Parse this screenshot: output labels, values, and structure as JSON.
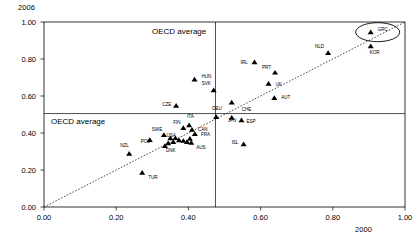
{
  "chart_data": {
    "type": "scatter",
    "title": "",
    "xlabel": "2000",
    "ylabel": "2006",
    "xlim": [
      0.0,
      1.0
    ],
    "ylim": [
      0.0,
      1.0
    ],
    "xticks": [
      "0.00",
      "0.20",
      "0.40",
      "0.60",
      "0.80",
      "1.00"
    ],
    "yticks": [
      "0.00",
      "0.20",
      "0.40",
      "0.60",
      "0.80",
      "1.00"
    ],
    "xtick_values": [
      0.0,
      0.2,
      0.4,
      0.6,
      0.8,
      1.0
    ],
    "ytick_values": [
      0.0,
      0.2,
      0.4,
      0.6,
      0.8,
      1.0
    ],
    "grid": false,
    "legend": "none",
    "annotations": [
      {
        "name": "oecd-average-vertical",
        "text": "OECD average",
        "value": 0.475,
        "orientation": "vertical"
      },
      {
        "name": "oecd-average-horizontal",
        "text": "OECD average",
        "value": 0.505,
        "orientation": "horizontal"
      }
    ],
    "reference_line": {
      "name": "45-degree-line",
      "style": "dotted",
      "from": [
        0.0,
        0.0
      ],
      "to": [
        1.0,
        1.0
      ]
    },
    "highlight": {
      "label": "GRC",
      "shape": "ellipse"
    },
    "points": [
      {
        "label": "GRC",
        "x": 0.905,
        "y": 0.945,
        "lx": 7,
        "ly": -1
      },
      {
        "label": "KOR",
        "x": 0.905,
        "y": 0.87,
        "lx": -1,
        "ly": 8
      },
      {
        "label": "NLD",
        "x": 0.787,
        "y": 0.833,
        "lx": -13,
        "ly": -5
      },
      {
        "label": "IRL",
        "x": 0.583,
        "y": 0.783,
        "lx": -14,
        "ly": 2
      },
      {
        "label": "PRT",
        "x": 0.64,
        "y": 0.727,
        "lx": -13,
        "ly": -4
      },
      {
        "label": "HUN",
        "x": 0.417,
        "y": 0.69,
        "lx": 7,
        "ly": -1
      },
      {
        "label": "UK",
        "x": 0.622,
        "y": 0.667,
        "lx": 7,
        "ly": 2
      },
      {
        "label": "SVK",
        "x": 0.47,
        "y": 0.632,
        "lx": -12,
        "ly": -5
      },
      {
        "label": "AUT",
        "x": 0.638,
        "y": 0.59,
        "lx": 7,
        "ly": 1
      },
      {
        "label": "CZE",
        "x": 0.366,
        "y": 0.548,
        "lx": -14,
        "ly": 0
      },
      {
        "label": "CHE",
        "x": 0.52,
        "y": 0.565,
        "lx": 10,
        "ly": 9
      },
      {
        "label": "DEU",
        "x": 0.477,
        "y": 0.487,
        "lx": -4,
        "ly": -7
      },
      {
        "label": "JPN",
        "x": 0.52,
        "y": 0.483,
        "lx": -4,
        "ly": 4
      },
      {
        "label": "ESP",
        "x": 0.547,
        "y": 0.47,
        "lx": 5,
        "ly": 3
      },
      {
        "label": "ITA",
        "x": 0.402,
        "y": 0.443,
        "lx": -2,
        "ly": -7
      },
      {
        "label": "FIN",
        "x": 0.386,
        "y": 0.428,
        "lx": -10,
        "ly": -4
      },
      {
        "label": "CAN",
        "x": 0.41,
        "y": 0.418,
        "lx": 6,
        "ly": 1
      },
      {
        "label": "FRA",
        "x": 0.418,
        "y": 0.395,
        "lx": 6,
        "ly": 2
      },
      {
        "label": "SWE",
        "x": 0.332,
        "y": 0.39,
        "lx": -12,
        "ly": -4
      },
      {
        "label": "USA",
        "x": 0.364,
        "y": 0.373,
        "lx": -9,
        "ly": -1
      },
      {
        "label": "NLD2",
        "x": 0.404,
        "y": 0.37,
        "lx": 4,
        "ly": 0
      },
      {
        "label": "POL",
        "x": 0.293,
        "y": 0.363,
        "lx": -9,
        "ly": 3
      },
      {
        "label": "AUS",
        "x": 0.408,
        "y": 0.348,
        "lx": 5,
        "ly": 6
      },
      {
        "label": "DNK",
        "x": 0.335,
        "y": 0.33,
        "lx": 1,
        "ly": 6
      },
      {
        "label": "ISL",
        "x": 0.553,
        "y": 0.34,
        "lx": -12,
        "ly": 0
      },
      {
        "label": "NZL",
        "x": 0.236,
        "y": 0.288,
        "lx": -9,
        "ly": -7
      },
      {
        "label": "TUR",
        "x": 0.272,
        "y": 0.186,
        "lx": 6,
        "ly": 6
      }
    ],
    "unlabeled_cluster_points": [
      {
        "x": 0.35,
        "y": 0.372
      },
      {
        "x": 0.374,
        "y": 0.362
      },
      {
        "x": 0.386,
        "y": 0.358
      },
      {
        "x": 0.396,
        "y": 0.352
      },
      {
        "x": 0.358,
        "y": 0.352
      },
      {
        "x": 0.344,
        "y": 0.345
      }
    ]
  }
}
